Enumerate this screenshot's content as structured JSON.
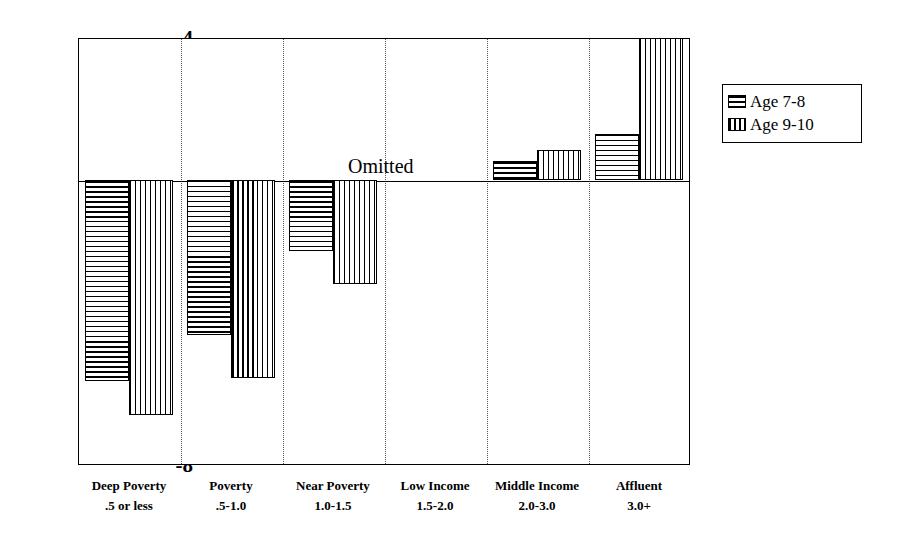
{
  "chart_data": {
    "type": "bar",
    "title": "",
    "subtitle": "",
    "xlabel": "",
    "ylabel": "",
    "ylim": [
      -8,
      4
    ],
    "yticks": [
      4,
      2,
      0,
      -2,
      -4,
      -6,
      -8
    ],
    "ytick_labels": [
      "4",
      "2",
      "0",
      "-2",
      "-4",
      "-6",
      "-8"
    ],
    "grid": "vertical-dotted",
    "legend_position": "right",
    "categories": [
      "Deep Poverty",
      "Poverty",
      "Near Poverty",
      "Low Income",
      "Middle Income",
      "Affluent"
    ],
    "category_sublabels": [
      ".5 or less",
      ".5-1.0",
      "1.0-1.5",
      "1.5-2.0",
      "2.0-3.0",
      "3.0+"
    ],
    "series": [
      {
        "name": "Age 7-8",
        "pattern": "horizontal-hatch",
        "values": [
          -5.65,
          -4.35,
          -2.0,
          null,
          0.55,
          1.3
        ]
      },
      {
        "name": "Age 9-10",
        "pattern": "vertical-hatch",
        "values": [
          -6.6,
          -5.55,
          -2.9,
          null,
          0.85,
          4.0
        ]
      }
    ],
    "annotations": [
      {
        "text": "Omitted",
        "category": "Low Income",
        "value": 0,
        "note": "reference category, no bars drawn"
      }
    ]
  },
  "legend": {
    "items": [
      {
        "label": "Age 7-8"
      },
      {
        "label": "Age 9-10"
      }
    ]
  },
  "colors": {
    "axis": "#000000",
    "grid": "#555555",
    "bar_outline": "#000000",
    "background": "#ffffff"
  }
}
